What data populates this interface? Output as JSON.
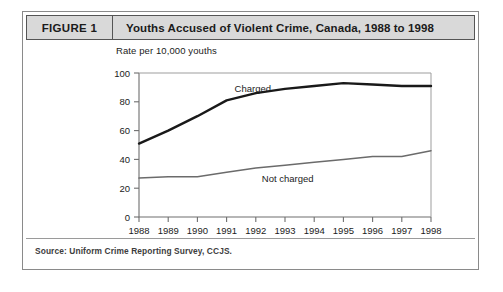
{
  "figure": {
    "tag": "FIGURE 1",
    "title": "Youths Accused of Violent Crime, Canada, 1988 to 1998",
    "source": "Source: Uniform Crime Reporting Survey, CCJS."
  },
  "chart_data": {
    "type": "line",
    "title": "Youths Accused of Violent Crime, Canada, 1988 to 1998",
    "xlabel": "",
    "ylabel": "Rate per 10,000 youths",
    "categories": [
      "1988",
      "1989",
      "1990",
      "1991",
      "1992",
      "1993",
      "1994",
      "1995",
      "1996",
      "1997",
      "1998"
    ],
    "x": [
      1988,
      1989,
      1990,
      1991,
      1992,
      1993,
      1994,
      1995,
      1996,
      1997,
      1998
    ],
    "xlim": [
      1988,
      1998
    ],
    "ylim": [
      0,
      100
    ],
    "yticks": [
      0,
      20,
      40,
      60,
      80,
      100
    ],
    "grid": false,
    "legend_position": "inline-labels",
    "series": [
      {
        "name": "Charged",
        "color": "#191919",
        "values": [
          51,
          60,
          70,
          81,
          86,
          89,
          91,
          93,
          92,
          91,
          91
        ]
      },
      {
        "name": "Not charged",
        "color": "#6b6b6b",
        "values": [
          27,
          28,
          28,
          31,
          34,
          36,
          38,
          40,
          42,
          42,
          46
        ]
      }
    ],
    "annotations": [
      {
        "text": "Charged",
        "series": "Charged"
      },
      {
        "text": "Not charged",
        "series": "Not charged"
      }
    ]
  }
}
